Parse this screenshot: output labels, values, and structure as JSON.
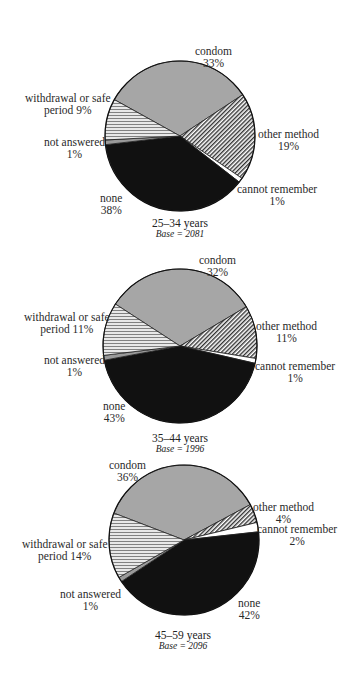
{
  "chart_data": [
    {
      "type": "pie",
      "title": "25–34 years",
      "base_label": "Base = 2081",
      "base": 2081,
      "slices": [
        {
          "label": "condom",
          "value": 33
        },
        {
          "label": "other method",
          "value": 19
        },
        {
          "label": "cannot remember",
          "value": 1
        },
        {
          "label": "none",
          "value": 38
        },
        {
          "label": "not answered",
          "value": 1
        },
        {
          "label": "withdrawal or safe period",
          "value": 9
        }
      ]
    },
    {
      "type": "pie",
      "title": "35–44 years",
      "base_label": "Base = 1996",
      "base": 1996,
      "slices": [
        {
          "label": "condom",
          "value": 32
        },
        {
          "label": "other method",
          "value": 11
        },
        {
          "label": "cannot remember",
          "value": 1
        },
        {
          "label": "none",
          "value": 43
        },
        {
          "label": "not answered",
          "value": 1
        },
        {
          "label": "withdrawal or safe period",
          "value": 11
        }
      ]
    },
    {
      "type": "pie",
      "title": "45–59 years",
      "base_label": "Base = 2096",
      "base": 2096,
      "slices": [
        {
          "label": "condom",
          "value": 36
        },
        {
          "label": "other method",
          "value": 4
        },
        {
          "label": "cannot remember",
          "value": 2
        },
        {
          "label": "none",
          "value": 42
        },
        {
          "label": "not answered",
          "value": 1
        },
        {
          "label": "withdrawal or safe period",
          "value": 14
        }
      ]
    }
  ],
  "colors": {
    "condom": "#a6a6a6",
    "other_method": "hatch-diagonal",
    "cannot_remember": "#ffffff",
    "none": "#111111",
    "not_answered": "#9a9a9a",
    "withdrawal": "hatch-wave"
  },
  "charts": [
    {
      "age": "25–34 years",
      "base": "Base = 2081",
      "labels": {
        "condom": [
          "condom",
          "33%"
        ],
        "other": [
          "other method",
          "19%"
        ],
        "cannot": [
          "cannot remember",
          "1%"
        ],
        "none": [
          "none",
          "38%"
        ],
        "notans": [
          "not answered",
          "1%"
        ],
        "withdrawal": [
          "withdrawal or safe",
          "period 9%"
        ]
      }
    },
    {
      "age": "35–44 years",
      "base": "Base = 1996",
      "labels": {
        "condom": [
          "condom",
          "32%"
        ],
        "other": [
          "other method",
          "11%"
        ],
        "cannot": [
          "cannot remember",
          "1%"
        ],
        "none": [
          "none",
          "43%"
        ],
        "notans": [
          "not answered",
          "1%"
        ],
        "withdrawal": [
          "withdrawal or safe",
          "period 11%"
        ]
      }
    },
    {
      "age": "45–59 years",
      "base": "Base = 2096",
      "labels": {
        "condom": [
          "condom",
          "36%"
        ],
        "other": [
          "other method",
          "4%"
        ],
        "cannot": [
          "cannot remember",
          "2%"
        ],
        "none": [
          "none",
          "42%"
        ],
        "notans": [
          "not answered",
          "1%"
        ],
        "withdrawal": [
          "withdrawal or safe",
          "period 14%"
        ]
      }
    }
  ]
}
